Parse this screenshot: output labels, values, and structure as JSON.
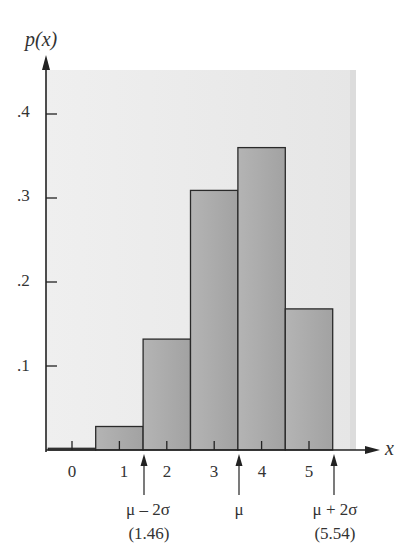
{
  "chart_data": {
    "type": "bar",
    "title": "",
    "xlabel": "x",
    "ylabel": "p(x)",
    "categories": [
      "0",
      "1",
      "2",
      "3",
      "4",
      "5"
    ],
    "values": [
      0.002,
      0.028,
      0.132,
      0.309,
      0.36,
      0.168
    ],
    "ylim": [
      0,
      0.45
    ],
    "yticks": [
      0.1,
      0.2,
      0.3,
      0.4
    ],
    "ytick_labels": [
      ".1",
      ".2",
      ".3",
      ".4"
    ],
    "grid": false,
    "legend": null,
    "annotations": [
      {
        "x": 1.46,
        "label": "μ – 2σ",
        "sublabel": "(1.46)"
      },
      {
        "x": 3.5,
        "label": "μ",
        "sublabel": ""
      },
      {
        "x": 5.54,
        "label": "μ + 2σ",
        "sublabel": "(5.54)"
      }
    ],
    "colors": {
      "bar_fill": "#a9a9a9",
      "bar_edge": "#2a2a2a",
      "panel_bg": "#ececec",
      "axis": "#222222"
    }
  },
  "labels": {
    "ylabel": "p(x)",
    "xlabel": "x",
    "ytick_1": ".1",
    "ytick_2": ".2",
    "ytick_3": ".3",
    "ytick_4": ".4",
    "xtick_0": "0",
    "xtick_1": "1",
    "xtick_2": "2",
    "xtick_3": "3",
    "xtick_4": "4",
    "xtick_5": "5",
    "ann_low": "μ – 2σ",
    "ann_low_val": "(1.46)",
    "ann_mu": "μ",
    "ann_high": "μ + 2σ",
    "ann_high_val": "(5.54)"
  }
}
